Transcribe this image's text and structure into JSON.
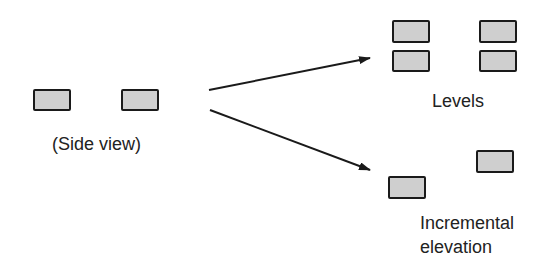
{
  "diagram": {
    "source": {
      "label": "(Side view)",
      "boxes": [
        {
          "x": 33,
          "y": 89,
          "w": 38,
          "h": 22
        },
        {
          "x": 121,
          "y": 89,
          "w": 38,
          "h": 22
        }
      ]
    },
    "targets": [
      {
        "label": "Levels",
        "boxes": [
          {
            "x": 392,
            "y": 20,
            "w": 38,
            "h": 23
          },
          {
            "x": 392,
            "y": 50,
            "w": 38,
            "h": 22
          },
          {
            "x": 479,
            "y": 20,
            "w": 38,
            "h": 23
          },
          {
            "x": 479,
            "y": 50,
            "w": 38,
            "h": 22
          }
        ]
      },
      {
        "label_line1": "Incremental",
        "label_line2": "elevation",
        "boxes": [
          {
            "x": 388,
            "y": 176,
            "w": 38,
            "h": 23
          },
          {
            "x": 476,
            "y": 150,
            "w": 38,
            "h": 23
          }
        ]
      }
    ],
    "arrows": [
      {
        "name": "arrow-to-levels",
        "from": [
          209,
          90
        ],
        "to": [
          370,
          58
        ]
      },
      {
        "name": "arrow-to-incremental-elevation",
        "from": [
          210,
          110
        ],
        "to": [
          370,
          170
        ]
      }
    ],
    "colors": {
      "stroke": "#1a1a1a",
      "fill": "#cfcfcf",
      "background": "#ffffff"
    }
  }
}
